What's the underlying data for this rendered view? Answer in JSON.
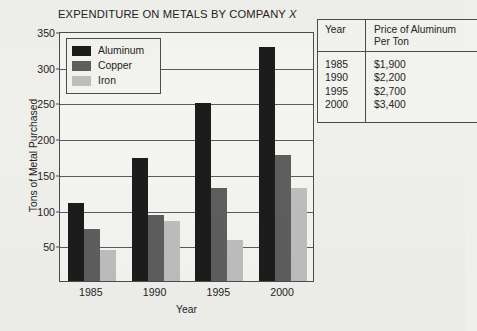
{
  "chart_data": {
    "type": "bar",
    "title": "EXPENDITURE ON METALS BY COMPANY X",
    "title_prefix": "EXPENDITURE ON METALS BY COMPANY ",
    "title_italic": "X",
    "xlabel": "Year",
    "ylabel": "Tons of Metal Purchased",
    "categories": [
      "1985",
      "1990",
      "1995",
      "2000"
    ],
    "series": [
      {
        "name": "Aluminum",
        "color": "#1c1c1c",
        "values": [
          109,
          172,
          249,
          328
        ]
      },
      {
        "name": "Copper",
        "color": "#5e5e5e",
        "values": [
          73,
          92,
          130,
          176
        ]
      },
      {
        "name": "Iron",
        "color": "#bdbdbd",
        "values": [
          43,
          84,
          58,
          130
        ]
      }
    ],
    "ylim": [
      0,
      350
    ],
    "yticks": [
      50,
      100,
      150,
      200,
      250,
      300,
      350
    ],
    "ytick_labels": [
      "50",
      "100",
      "150",
      "200",
      "250",
      "300",
      "350"
    ],
    "grid": true,
    "legend_position": "top-left"
  },
  "legend": {
    "items": [
      {
        "label": "Aluminum",
        "color": "#1c1c1c"
      },
      {
        "label": "Copper",
        "color": "#5e5e5e"
      },
      {
        "label": "Iron",
        "color": "#bdbdbd"
      }
    ]
  },
  "price_table": {
    "headers": [
      "Year",
      "Price of Aluminum Per Ton"
    ],
    "header_year": "Year",
    "header_price_line1": "Price of Aluminum",
    "header_price_line2": "Per Ton",
    "years": [
      "1985",
      "1990",
      "1995",
      "2000"
    ],
    "prices": [
      "$1,900",
      "$2,200",
      "$2,700",
      "$3,400"
    ]
  },
  "colors": {
    "background": "#efefeb",
    "axis": "#4c4c4c",
    "text": "#242424"
  }
}
